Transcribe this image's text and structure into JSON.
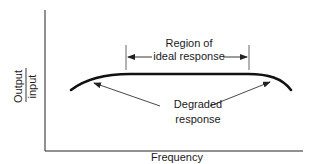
{
  "diagram": {
    "title": "",
    "y_axis": {
      "numerator": "Output",
      "denominator": "input"
    },
    "x_axis": {
      "label": "Frequency"
    },
    "annotations": {
      "region_line1": "Region of",
      "region_line2": "ideal response",
      "degraded_line1": "Degraded",
      "degraded_line2": "response"
    },
    "curve": {
      "description": "Response curve flat in the middle, rolling off at both low and high frequency ends",
      "color": "#111111"
    }
  }
}
